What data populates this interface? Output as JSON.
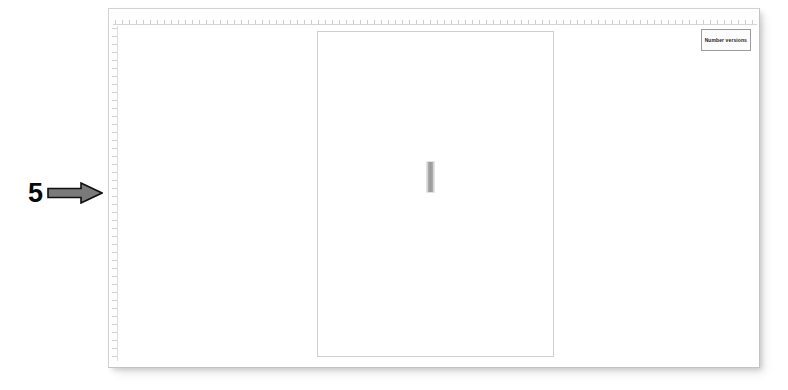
{
  "annotation": {
    "number": "5",
    "arrow_icon": "arrow-right-icon",
    "arrow_fill": "#7a7a7a",
    "arrow_stroke": "#101010",
    "number_color": "#0a0a0a"
  },
  "window": {
    "background": "#ffffff",
    "border_color": "#d2d2d2"
  },
  "rulers": {
    "horizontal_name": "horizontal-ruler",
    "vertical_name": "vertical-ruler",
    "tick_color": "#969696"
  },
  "document": {
    "page_border_color": "#cfcfcf",
    "page_background": "#ffffff",
    "caret": {
      "name": "text-caret",
      "color": "#9a9a9a"
    }
  },
  "toolbar": {
    "button_label": "Number versions",
    "button_border": "#9b9b9b",
    "button_background": "#fcfcfc"
  }
}
